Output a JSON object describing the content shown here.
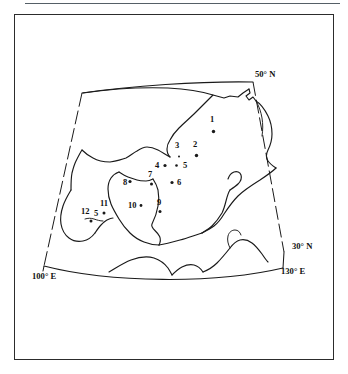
{
  "figure": {
    "type": "map",
    "frame": {
      "border_color": "#2c2c2c"
    },
    "top_rule": {
      "color": "#555f66"
    }
  },
  "axis_labels": [
    {
      "id": "lat-50n",
      "text": "50° N",
      "x": 255,
      "y": 77
    },
    {
      "id": "lat-30n",
      "text": "30° N",
      "x": 292,
      "y": 249
    },
    {
      "id": "lon-130e",
      "text": "130° E",
      "x": 281,
      "y": 274
    },
    {
      "id": "lon-100e",
      "text": "100° E",
      "x": 32,
      "y": 279
    }
  ],
  "sites": [
    {
      "id": "1",
      "label": "1",
      "lx": 210,
      "ly": 122,
      "px": 213.5,
      "py": 131.5,
      "r": 1.7
    },
    {
      "id": "2",
      "label": "2",
      "lx": 193,
      "ly": 147,
      "px": 196.5,
      "py": 155.5,
      "r": 1.7
    },
    {
      "id": "3",
      "label": "3",
      "lx": 175,
      "ly": 148,
      "px": 179.0,
      "py": 156.5,
      "r": 1.0
    },
    {
      "id": "4",
      "label": "4",
      "lx": 155,
      "ly": 168,
      "px": 165.0,
      "py": 165.5,
      "r": 1.6
    },
    {
      "id": "5",
      "label": "5",
      "lx": 183,
      "ly": 168,
      "px": 176.5,
      "py": 165.5,
      "r": 1.3
    },
    {
      "id": "6",
      "label": "6",
      "lx": 177,
      "ly": 185,
      "px": 172.0,
      "py": 182.5,
      "r": 1.6
    },
    {
      "id": "7",
      "label": "7",
      "lx": 148,
      "ly": 177,
      "px": 151.5,
      "py": 184.0,
      "r": 1.5
    },
    {
      "id": "8",
      "label": "8",
      "lx": 123,
      "ly": 185,
      "px": 130.0,
      "py": 181.5,
      "r": 1.6
    },
    {
      "id": "9",
      "label": "9",
      "lx": 157,
      "ly": 205,
      "px": 160.0,
      "py": 211.5,
      "r": 1.5
    },
    {
      "id": "10",
      "label": "10",
      "lx": 128,
      "ly": 208,
      "px": 141.0,
      "py": 205.5,
      "r": 1.4
    },
    {
      "id": "11",
      "label": "11",
      "lx": 100,
      "ly": 206,
      "px": 104.0,
      "py": 213.0,
      "r": 1.5
    },
    {
      "id": "12",
      "label": "12",
      "lx": 81,
      "ly": 214,
      "px": 91.0,
      "py": 221.0,
      "r": 1.5
    }
  ],
  "extra_marks": [
    {
      "id": "mark-5-glyph",
      "text": "5",
      "x": 94,
      "y": 216
    }
  ],
  "graticule": {
    "top_edge": "M 71,205 L 82,94 L 255,82 L 282,250",
    "note": "projected quadrilateral frame of the map area"
  }
}
